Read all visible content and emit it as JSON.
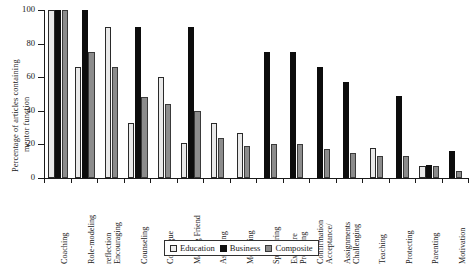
{
  "chart_data": {
    "type": "bar",
    "title": "",
    "xlabel": "",
    "ylabel": "Percentage of articles containing mentor function",
    "ylabel_lines": [
      "Percentage of articles containing",
      "mentor function"
    ],
    "ylim": [
      0,
      100
    ],
    "yticks": [
      0,
      20,
      40,
      60,
      80,
      100
    ],
    "grid": false,
    "legend_position": "bottom-center",
    "categories": [
      "Coaching",
      "Role-modeling",
      "Encouraging reflection",
      "Counseling",
      "Colleague",
      "Making Friend",
      "Assessing",
      "Mediating",
      "Sponsoring",
      "Providing Exposure",
      "Acceptance/Confirmation",
      "Challenging Assignments",
      "Teaching",
      "Protecting",
      "Parenting",
      "Motivation"
    ],
    "category_lines": [
      [
        "Coaching"
      ],
      [
        "Role-modeling"
      ],
      [
        "Encouraging",
        "reflection"
      ],
      [
        "Counseling"
      ],
      [
        "Colleague"
      ],
      [
        "Making Friend"
      ],
      [
        "Assessing"
      ],
      [
        "Mediating"
      ],
      [
        "Sponsoring"
      ],
      [
        "Providing",
        "Exposure"
      ],
      [
        "Acceptance/",
        "Confirmation"
      ],
      [
        "Challenging",
        "Assignments"
      ],
      [
        "Teaching"
      ],
      [
        "Protecting"
      ],
      [
        "Parenting"
      ],
      [
        "Motivation"
      ]
    ],
    "series": [
      {
        "name": "Education",
        "color": "#e9e9e9",
        "values": [
          100,
          66,
          90,
          33,
          60,
          21,
          33,
          27,
          0,
          0,
          0,
          0,
          18,
          0,
          7,
          0
        ]
      },
      {
        "name": "Business",
        "color": "#0d0d0d",
        "values": [
          100,
          100,
          0,
          90,
          0,
          90,
          0,
          0,
          75,
          75,
          66,
          57,
          0,
          49,
          8,
          16
        ]
      },
      {
        "name": "Composite",
        "color": "#8c8c8c",
        "values": [
          100,
          75,
          66,
          48,
          44,
          40,
          24,
          19,
          20,
          20,
          17,
          15,
          13,
          13,
          7,
          4
        ]
      }
    ]
  },
  "legend": {
    "items": [
      {
        "label": "Education",
        "swatch": "education"
      },
      {
        "label": "Business",
        "swatch": "business"
      },
      {
        "label": "Composite",
        "swatch": "composite"
      }
    ]
  }
}
